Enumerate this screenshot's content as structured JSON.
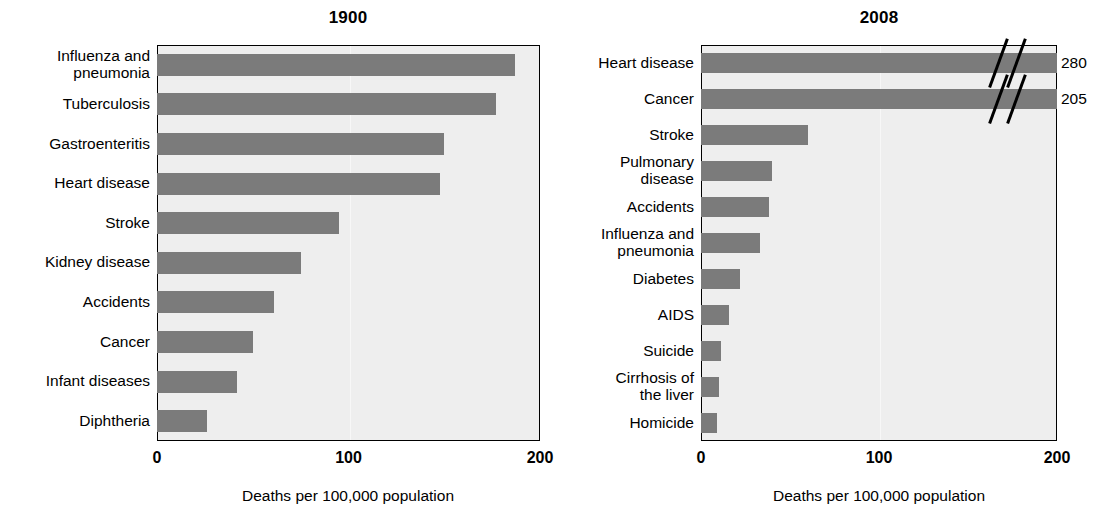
{
  "figure": {
    "background_color": "#ffffff",
    "bar_color": "#7b7b7b",
    "plot_background_color": "#eeeeee",
    "axis_color": "#000000"
  },
  "chart_data": [
    {
      "type": "bar",
      "orientation": "horizontal",
      "title": "1900",
      "xlabel": "Deaths per 100,000 population",
      "ylabel": "",
      "xlim": [
        0,
        200
      ],
      "xticks": [
        0,
        100,
        200
      ],
      "xtick_labels": [
        "0",
        "100",
        "200"
      ],
      "grid": false,
      "categories": [
        "Influenza and\npneumonia",
        "Tuberculosis",
        "Gastroenteritis",
        "Heart disease",
        "Stroke",
        "Kidney disease",
        "Accidents",
        "Cancer",
        "Infant diseases",
        "Diphtheria"
      ],
      "values": [
        187,
        177,
        150,
        148,
        95,
        75,
        61,
        50,
        42,
        26
      ],
      "value_labels": []
    },
    {
      "type": "bar",
      "orientation": "horizontal",
      "title": "2008",
      "xlabel": "Deaths per 100,000 population",
      "ylabel": "",
      "xlim": [
        0,
        200
      ],
      "xticks": [
        0,
        100,
        200
      ],
      "xtick_labels": [
        "0",
        "100",
        "200"
      ],
      "grid": false,
      "categories": [
        "Heart disease",
        "Cancer",
        "Stroke",
        "Pulmonary\ndisease",
        "Accidents",
        "Influenza and\npneumonia",
        "Diabetes",
        "AIDS",
        "Suicide",
        "Cirrhosis of\nthe liver",
        "Homicide"
      ],
      "values": [
        280,
        205,
        60,
        40,
        38,
        33,
        22,
        16,
        11,
        10,
        9
      ],
      "value_labels": [
        "280",
        "205",
        "",
        "",
        "",
        "",
        "",
        "",
        "",
        "",
        ""
      ],
      "axis_break": {
        "present": true,
        "applies_to": [
          "Heart disease",
          "Cancer"
        ],
        "note": "double slash break near right edge; bars truncated"
      }
    }
  ],
  "left": {
    "title": "1900",
    "xaxis_title": "Deaths per 100,000 population",
    "ticks": [
      "0",
      "100",
      "200"
    ],
    "rows": [
      {
        "label": "Influenza and\npneumonia",
        "value": 187
      },
      {
        "label": "Tuberculosis",
        "value": 177
      },
      {
        "label": "Gastroenteritis",
        "value": 150
      },
      {
        "label": "Heart disease",
        "value": 148
      },
      {
        "label": "Stroke",
        "value": 95
      },
      {
        "label": "Kidney disease",
        "value": 75
      },
      {
        "label": "Accidents",
        "value": 61
      },
      {
        "label": "Cancer",
        "value": 50
      },
      {
        "label": "Infant diseases",
        "value": 42
      },
      {
        "label": "Diphtheria",
        "value": 26
      }
    ]
  },
  "right": {
    "title": "2008",
    "xaxis_title": "Deaths per 100,000 population",
    "ticks": [
      "0",
      "100",
      "200"
    ],
    "rows": [
      {
        "label": "Heart disease",
        "value": 280,
        "value_label": "280",
        "broken": true
      },
      {
        "label": "Cancer",
        "value": 205,
        "value_label": "205",
        "broken": true
      },
      {
        "label": "Stroke",
        "value": 60,
        "value_label": "",
        "broken": false
      },
      {
        "label": "Pulmonary\ndisease",
        "value": 40,
        "value_label": "",
        "broken": false
      },
      {
        "label": "Accidents",
        "value": 38,
        "value_label": "",
        "broken": false
      },
      {
        "label": "Influenza and\npneumonia",
        "value": 33,
        "value_label": "",
        "broken": false
      },
      {
        "label": "Diabetes",
        "value": 22,
        "value_label": "",
        "broken": false
      },
      {
        "label": "AIDS",
        "value": 16,
        "value_label": "",
        "broken": false
      },
      {
        "label": "Suicide",
        "value": 11,
        "value_label": "",
        "broken": false
      },
      {
        "label": "Cirrhosis of\nthe liver",
        "value": 10,
        "value_label": "",
        "broken": false
      },
      {
        "label": "Homicide",
        "value": 9,
        "value_label": "",
        "broken": false
      }
    ]
  }
}
